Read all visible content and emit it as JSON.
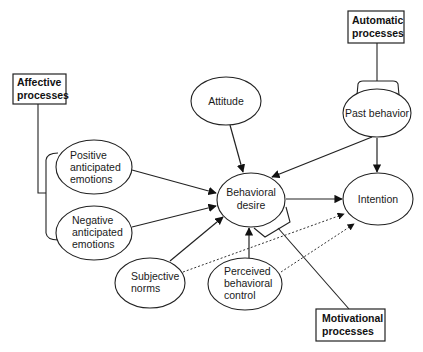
{
  "diagram": {
    "type": "path-model",
    "process_boxes": {
      "affective": {
        "line1": "Affective",
        "line2": "processes"
      },
      "automatic": {
        "line1": "Automatic",
        "line2": "processes"
      },
      "motivational": {
        "line1": "Motivational",
        "line2": "processes"
      }
    },
    "nodes": {
      "attitude": {
        "lines": [
          "Attitude"
        ]
      },
      "past_behavior": {
        "lines": [
          "Past behavior"
        ]
      },
      "positive_emotions": {
        "lines": [
          "Positive",
          "anticipated",
          "emotions"
        ]
      },
      "negative_emotions": {
        "lines": [
          "Negative",
          "anticipated",
          "emotions"
        ]
      },
      "behavioral_desire": {
        "lines": [
          "Behavioral",
          "desire"
        ]
      },
      "intention": {
        "lines": [
          "Intention"
        ]
      },
      "subjective_norms": {
        "lines": [
          "Subjective",
          "norms"
        ]
      },
      "perceived_control": {
        "lines": [
          "Perceived",
          "behavioral",
          "control"
        ]
      }
    },
    "edges": [
      {
        "from": "Attitude",
        "to": "Behavioral desire",
        "style": "solid"
      },
      {
        "from": "Past behavior",
        "to": "Behavioral desire",
        "style": "solid"
      },
      {
        "from": "Past behavior",
        "to": "Intention",
        "style": "solid"
      },
      {
        "from": "Positive anticipated emotions",
        "to": "Behavioral desire",
        "style": "solid"
      },
      {
        "from": "Negative anticipated emotions",
        "to": "Behavioral desire",
        "style": "solid"
      },
      {
        "from": "Subjective norms",
        "to": "Behavioral desire",
        "style": "solid"
      },
      {
        "from": "Perceived behavioral control",
        "to": "Behavioral desire",
        "style": "solid"
      },
      {
        "from": "Behavioral desire",
        "to": "Intention",
        "style": "solid"
      },
      {
        "from": "Subjective norms",
        "to": "Intention",
        "style": "dotted"
      },
      {
        "from": "Perceived behavioral control",
        "to": "Intention",
        "style": "dotted"
      }
    ],
    "groupings": [
      {
        "box": "Affective processes",
        "covers": [
          "Positive anticipated emotions",
          "Negative anticipated emotions"
        ]
      },
      {
        "box": "Automatic processes",
        "covers": [
          "Past behavior"
        ]
      },
      {
        "box": "Motivational processes",
        "covers": [
          "Behavioral desire"
        ]
      }
    ]
  }
}
